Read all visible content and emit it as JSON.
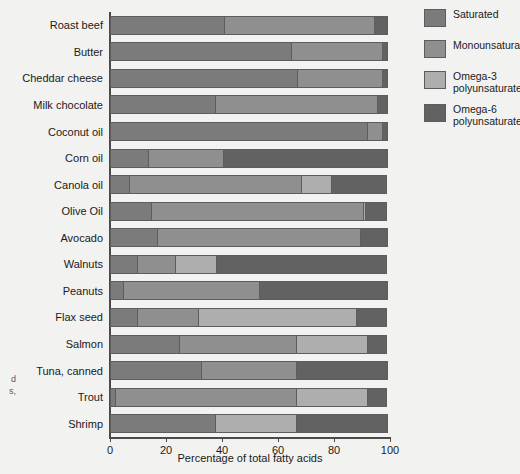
{
  "chart_data": {
    "type": "bar",
    "orientation": "horizontal",
    "stacked": true,
    "title": "",
    "xlabel": "Percentage of total fatty acids",
    "ylabel": "",
    "xlim": [
      0,
      100
    ],
    "xticks": [
      0,
      20,
      40,
      60,
      80,
      100
    ],
    "grid": false,
    "legend_position": "right",
    "categories": [
      "Roast beef",
      "Butter",
      "Cheddar cheese",
      "Milk chocolate",
      "Coconut oil",
      "Corn oil",
      "Canola oil",
      "Olive Oil",
      "Avocado",
      "Walnuts",
      "Peanuts",
      "Flax seed",
      "Salmon",
      "Tuna, canned",
      "Trout",
      "Shrimp"
    ],
    "series": [
      {
        "name": "Saturated",
        "color": "#7b7b7b",
        "values": [
          41,
          65,
          67,
          38,
          92,
          14,
          7,
          15,
          17,
          10,
          5,
          10,
          25,
          33,
          2,
          38
        ]
      },
      {
        "name": "Monounsaturated",
        "color": "#8f8f8f",
        "values": [
          54,
          33,
          31,
          58,
          6,
          27,
          62,
          76,
          73,
          14,
          49,
          22,
          42,
          34,
          65,
          0
        ]
      },
      {
        "name": "Omega-3 polyunsaturated",
        "color": "#aeaeae",
        "values": [
          0,
          0,
          0,
          0,
          0,
          0,
          11,
          1,
          0,
          15,
          0,
          57,
          26,
          0,
          26,
          29
        ]
      },
      {
        "name": "Omega-6 polyunsaturated",
        "color": "#626262",
        "values": [
          5,
          2,
          2,
          4,
          2,
          59,
          20,
          8,
          10,
          61,
          46,
          11,
          7,
          33,
          7,
          33
        ]
      }
    ]
  },
  "legend": {
    "items": [
      {
        "label": "Saturated",
        "color": "#7b7b7b"
      },
      {
        "label": "Monounsaturated",
        "color": "#8f8f8f"
      },
      {
        "label": "Omega-3\npolyunsaturated",
        "color": "#aeaeae"
      },
      {
        "label": "Omega-6\npolyunsaturated",
        "color": "#626262"
      }
    ]
  },
  "side_caption": "d\ns,"
}
